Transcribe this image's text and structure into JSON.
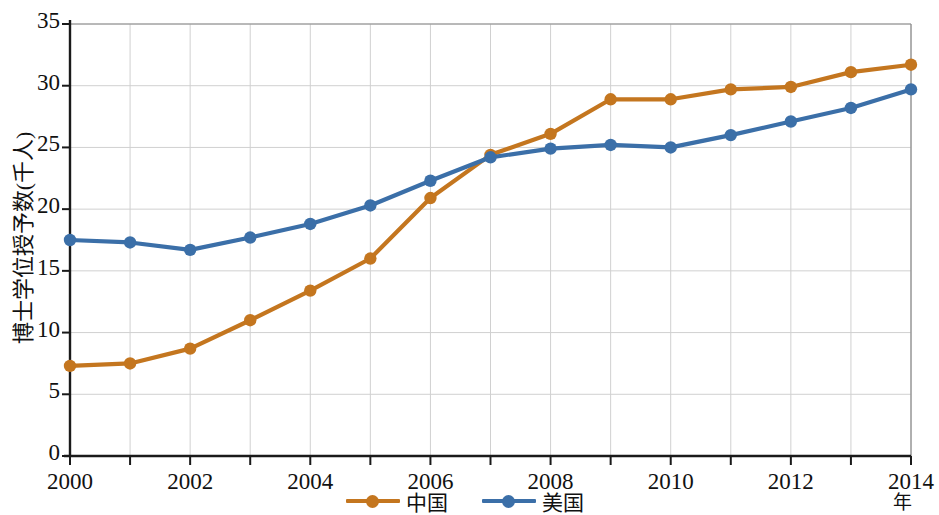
{
  "chart_data": {
    "type": "line",
    "title": "",
    "xlabel": "年",
    "ylabel": "博士学位授予数(千人)",
    "x": [
      2000,
      2001,
      2002,
      2003,
      2004,
      2005,
      2006,
      2007,
      2008,
      2009,
      2010,
      2011,
      2012,
      2013,
      2014
    ],
    "xtick_labels": [
      "2000",
      "2002",
      "2004",
      "2006",
      "2008",
      "2010",
      "2012",
      "2014"
    ],
    "xtick_values": [
      2000,
      2002,
      2004,
      2006,
      2008,
      2010,
      2012,
      2014
    ],
    "xlim": [
      2000,
      2014
    ],
    "ytick_labels": [
      "0",
      "5",
      "10",
      "15",
      "20",
      "25",
      "30",
      "35"
    ],
    "ytick_values": [
      0,
      5,
      10,
      15,
      20,
      25,
      30,
      35
    ],
    "ylim": [
      0,
      35
    ],
    "grid": true,
    "legend_position": "bottom-center",
    "series": [
      {
        "name": "中国",
        "color": "#C4761F",
        "marker": "circle",
        "values": [
          7.3,
          7.5,
          8.7,
          11.0,
          13.4,
          16.0,
          20.9,
          24.4,
          26.1,
          28.9,
          28.9,
          29.7,
          29.9,
          31.1,
          31.7
        ]
      },
      {
        "name": "美国",
        "color": "#3B6FA8",
        "marker": "circle",
        "values": [
          17.5,
          17.3,
          16.7,
          17.7,
          18.8,
          20.3,
          22.3,
          24.2,
          24.9,
          25.2,
          25.0,
          26.0,
          27.1,
          28.2,
          29.7
        ]
      }
    ]
  },
  "legend": {
    "items": [
      {
        "label": "中国",
        "color": "#C4761F"
      },
      {
        "label": "美国",
        "color": "#3B6FA8"
      }
    ]
  },
  "axis": {
    "y_title": "博士学位授予数(千人)",
    "x_title": "年"
  }
}
